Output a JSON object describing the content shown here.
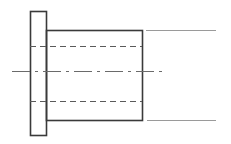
{
  "canvas": {
    "width": 231,
    "height": 144,
    "background": "#ffffff",
    "title": "Sectional view of flanged bushing"
  },
  "style": {
    "object_line_color": "#3a3a3a",
    "object_line_width": 1.6,
    "hidden_line_color": "#5a5a5a",
    "hidden_line_width": 1.1,
    "hidden_dash": "6 4",
    "center_line_color": "#6a6a6a",
    "center_line_width": 1.1,
    "center_dash": "18 5 3 5",
    "thin_line_color": "#9a9a9a",
    "thin_line_width": 1.0
  },
  "chart_data": {
    "type": "diagram",
    "xlabel": "",
    "ylabel": "",
    "units": "pixels",
    "xlim": [
      0,
      231
    ],
    "ylim": [
      0,
      144
    ],
    "grid": false,
    "legend": "none",
    "shapes": [
      {
        "name": "flange-rectangle",
        "kind": "rectangle",
        "line_style": "continuous-thick",
        "x": 30,
        "y": 11,
        "width": 16,
        "height": 124
      },
      {
        "name": "body-rectangle",
        "kind": "rectangle",
        "line_style": "continuous-thick",
        "x": 46,
        "y": 30,
        "width": 96,
        "height": 90
      }
    ],
    "lines": [
      {
        "name": "hidden-line-upper",
        "kind": "hidden",
        "x1": 30,
        "y1": 46,
        "x2": 142,
        "y2": 46
      },
      {
        "name": "hidden-line-lower",
        "kind": "hidden",
        "x1": 30,
        "y1": 101,
        "x2": 142,
        "y2": 101
      },
      {
        "name": "center-axis-line",
        "kind": "center",
        "x1": 12,
        "y1": 71,
        "x2": 163,
        "y2": 71
      },
      {
        "name": "thin-extension-line-top",
        "kind": "thin",
        "x1": 146,
        "y1": 30,
        "x2": 216,
        "y2": 30
      },
      {
        "name": "thin-extension-line-bottom",
        "kind": "thin",
        "x1": 147,
        "y1": 120,
        "x2": 216,
        "y2": 120
      }
    ]
  },
  "labels": {
    "items": []
  }
}
